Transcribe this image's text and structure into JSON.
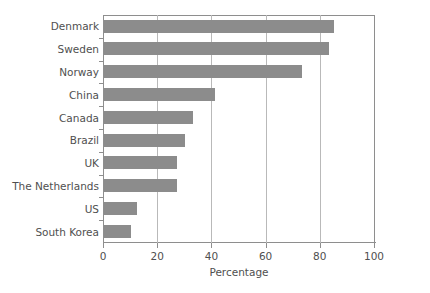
{
  "chart_data": {
    "type": "bar",
    "orientation": "horizontal",
    "title": "",
    "xlabel": "Percentage",
    "ylabel": "",
    "categories": [
      "Denmark",
      "Sweden",
      "Norway",
      "China",
      "Canada",
      "Brazil",
      "UK",
      "The Netherlands",
      "US",
      "South Korea"
    ],
    "values": [
      85,
      83,
      73,
      41,
      33,
      30,
      27,
      27,
      12,
      10
    ],
    "xlim": [
      0,
      100
    ],
    "xticks": [
      0,
      20,
      40,
      60,
      80,
      100
    ],
    "xtick_labels": [
      "0",
      "20",
      "40",
      "60",
      "80",
      "100"
    ],
    "grid": "vertical",
    "legend": null,
    "bar_color": "#8c8c8c",
    "axis_color": "#8e8e8e",
    "gridline_color": "#b9b9b9",
    "background": "#ffffff"
  }
}
